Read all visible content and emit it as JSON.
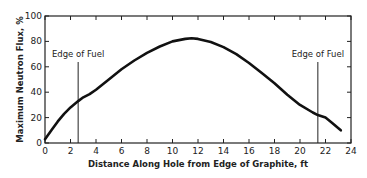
{
  "chart_data": {
    "type": "line",
    "title": "",
    "xlabel": "Distance Along Hole from Edge of Graphite, ft",
    "ylabel": "Maximum Neutron Flux, %",
    "xlim": [
      0,
      24
    ],
    "ylim": [
      0,
      100
    ],
    "xticks": [
      0,
      2,
      4,
      6,
      8,
      10,
      12,
      14,
      16,
      18,
      20,
      22,
      24
    ],
    "yticks": [
      0,
      20,
      40,
      60,
      80,
      100
    ],
    "grid": false,
    "series": [
      {
        "name": "Maximum Neutron Flux",
        "x": [
          0,
          0.5,
          1,
          1.5,
          2,
          2.6,
          3,
          3.5,
          4,
          5,
          6,
          7,
          8,
          9,
          10,
          11,
          11.5,
          12,
          13,
          14,
          15,
          16,
          17,
          18,
          19,
          20,
          21,
          21.4,
          22,
          22.5,
          23.2
        ],
        "y": [
          3,
          10,
          17,
          23,
          28,
          33,
          36,
          38.5,
          42,
          50,
          58,
          65,
          71,
          76,
          80,
          82,
          82.5,
          82,
          79.5,
          75.5,
          70,
          63,
          55,
          47,
          38,
          30,
          24,
          22,
          20,
          16,
          10
        ]
      }
    ],
    "annotations": [
      {
        "label": "Edge of Fuel",
        "x": 2.6
      },
      {
        "label": "Edge of Fuel",
        "x": 21.4
      }
    ]
  }
}
